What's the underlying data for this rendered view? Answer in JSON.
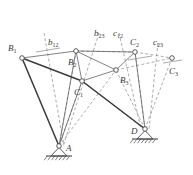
{
  "figure": {
    "type": "kinematic-linkage-diagram",
    "colors": {
      "link_solid": "#3d3d3d",
      "thin_line": "#5a5a5a",
      "dashed_line": "#8a8a8a",
      "node_stroke": "#4a4a4a",
      "node_fill": "#ffffff",
      "ground_hatch": "#4a4a4a",
      "label_text": "#3a3a3a"
    },
    "nodes": [
      {
        "id": "B1",
        "label": "B",
        "sub": "1",
        "x": 22,
        "y": 58,
        "label_x": 8,
        "label_y": 44
      },
      {
        "id": "B2",
        "label": "B",
        "sub": "2",
        "x": 76,
        "y": 51,
        "label_x": 68,
        "label_y": 58
      },
      {
        "id": "B3",
        "label": "B",
        "sub": "3",
        "x": 116,
        "y": 70,
        "label_x": 120,
        "label_y": 76
      },
      {
        "id": "C1",
        "label": "C",
        "sub": "1",
        "x": 82,
        "y": 81,
        "label_x": 74,
        "label_y": 88
      },
      {
        "id": "C2",
        "label": "C",
        "sub": "2",
        "x": 135,
        "y": 52,
        "label_x": 130,
        "label_y": 38
      },
      {
        "id": "C3",
        "label": "C",
        "sub": "3",
        "x": 172,
        "y": 58,
        "label_x": 169,
        "label_y": 67
      },
      {
        "id": "A",
        "label": "A",
        "sub": "",
        "x": 59,
        "y": 146,
        "label_x": 66,
        "label_y": 144
      },
      {
        "id": "D",
        "label": "D",
        "sub": "",
        "x": 145,
        "y": 129,
        "label_x": 131,
        "label_y": 127
      }
    ],
    "construction_labels": [
      {
        "id": "b12",
        "label": "b",
        "sub": "12",
        "x": 48,
        "y": 38
      },
      {
        "id": "b23",
        "label": "b",
        "sub": "23",
        "x": 94,
        "y": 29
      },
      {
        "id": "c12",
        "label": "c",
        "sub": "12",
        "x": 113,
        "y": 29
      },
      {
        "id": "c23",
        "label": "c",
        "sub": "23",
        "x": 153,
        "y": 38
      }
    ],
    "solid_links": [
      {
        "name": "link-B1-A",
        "from": "B1",
        "to": "A",
        "width": 1.5
      },
      {
        "name": "link-B1-C1",
        "from": "B1",
        "to": "C1",
        "width": 1.5
      },
      {
        "name": "link-C1-D",
        "from": "C1",
        "to": "D",
        "width": 1.5
      }
    ],
    "thin_lines": [
      {
        "name": "line-B1-B2",
        "from": "B1",
        "to": "B2"
      },
      {
        "name": "line-B2-C1",
        "from": "B2",
        "to": "C1"
      },
      {
        "name": "line-B2-B3",
        "from": "B2",
        "to": "B3"
      },
      {
        "name": "line-B2-C2",
        "from": "B2",
        "to": "C2"
      },
      {
        "name": "line-B3-C1",
        "from": "B3",
        "to": "C1"
      },
      {
        "name": "line-B3-C2",
        "from": "B3",
        "to": "C2"
      },
      {
        "name": "line-A-B2",
        "from": "A",
        "to": "B2"
      },
      {
        "name": "line-A-C1",
        "from": "A",
        "to": "C1"
      },
      {
        "name": "line-D-C2",
        "from": "D",
        "to": "C2"
      },
      {
        "name": "line-D-C1",
        "from": "D",
        "to": "C1"
      }
    ],
    "dashed_lines": [
      {
        "name": "dash-B2-C2-top",
        "from": "B2",
        "to": "C2"
      },
      {
        "name": "dash-C2-C3",
        "from": "C2",
        "to": "C3"
      },
      {
        "name": "dash-B3-C3",
        "from": "B3",
        "to": "C3"
      },
      {
        "name": "dash-A-B1",
        "from": "A",
        "to": "B1"
      },
      {
        "name": "dash-A-B2",
        "from": "A",
        "to": "B2"
      },
      {
        "name": "dash-A-B3",
        "from": "A",
        "to": "B3"
      },
      {
        "name": "dash-A-C1",
        "from": "A",
        "to": "C1"
      },
      {
        "name": "dash-D-C1",
        "from": "D",
        "to": "C1"
      },
      {
        "name": "dash-D-C2",
        "from": "D",
        "to": "C2"
      },
      {
        "name": "dash-D-C3",
        "from": "D",
        "to": "C3"
      },
      {
        "name": "dash-D-B3",
        "from": "D",
        "to": "B3"
      }
    ],
    "bisectors": [
      {
        "name": "bisector-b12",
        "x1": 44,
        "y1": 33,
        "x2": 64,
        "y2": 146
      },
      {
        "name": "bisector-b23",
        "x1": 99,
        "y1": 33,
        "x2": 63,
        "y2": 147
      },
      {
        "name": "bisector-c12",
        "x1": 119,
        "y1": 33,
        "x2": 141,
        "y2": 129
      },
      {
        "name": "bisector-c23",
        "x1": 158,
        "y1": 43,
        "x2": 149,
        "y2": 129
      },
      {
        "name": "tick-b12",
        "x1": 36,
        "y1": 52,
        "x2": 60,
        "y2": 48
      },
      {
        "name": "tick-c12",
        "x1": 128,
        "y1": 60,
        "x2": 152,
        "y2": 56
      },
      {
        "name": "tick-c23",
        "x1": 163,
        "y1": 63,
        "x2": 182,
        "y2": 60
      }
    ],
    "supports": [
      {
        "name": "ground-support-A",
        "pivot_x": 59,
        "pivot_y": 146,
        "half_width": 13,
        "height": 10,
        "hatch_count": 7
      },
      {
        "name": "ground-support-D",
        "pivot_x": 145,
        "pivot_y": 129,
        "half_width": 13,
        "height": 10,
        "hatch_count": 7
      }
    ]
  }
}
